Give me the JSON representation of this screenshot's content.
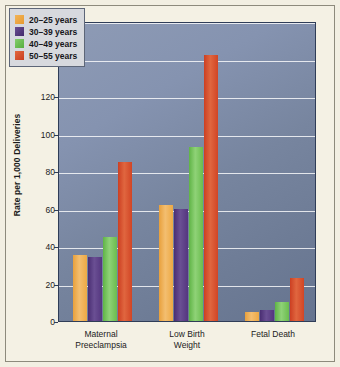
{
  "chart_data": {
    "type": "bar",
    "title": "",
    "subtitle": "",
    "xlabel": "",
    "ylabel": "Rate per 1,000 Deliveries",
    "ylim": [
      0,
      160
    ],
    "yticks": [
      0,
      20,
      40,
      60,
      80,
      100,
      120,
      140,
      160
    ],
    "ytick_labels": [
      "0",
      "20",
      "40",
      "60",
      "80",
      "100",
      "120",
      "140",
      "160"
    ],
    "grid": true,
    "legend_position": "top-left",
    "categories": [
      "Maternal Preeclampsia",
      "Low Birth Weight",
      "Fetal Death"
    ],
    "category_lines": [
      [
        "Maternal",
        "Preeclampsia"
      ],
      [
        "Low Birth",
        "Weight"
      ],
      [
        "Fetal Death",
        ""
      ]
    ],
    "series": [
      {
        "name": "20–25 years",
        "color": "#eda944",
        "values": [
          35,
          62,
          5
        ]
      },
      {
        "name": "30–39 years",
        "color": "#54367f",
        "values": [
          34,
          60,
          6
        ]
      },
      {
        "name": "40–49 years",
        "color": "#6abc4e",
        "values": [
          45,
          93,
          10
        ]
      },
      {
        "name": "50–55 years",
        "color": "#d14525",
        "values": [
          85,
          142,
          23
        ]
      }
    ]
  },
  "legend": {
    "items": [
      {
        "label": "20–25 years"
      },
      {
        "label": "30–39 years"
      },
      {
        "label": "40–49 years"
      },
      {
        "label": "50–55 years"
      }
    ]
  },
  "axes": {
    "y_title": "Rate per 1,000 Deliveries"
  },
  "colors": {
    "series_1": "#eda944",
    "series_2": "#54367f",
    "series_3": "#6abc4e",
    "series_4": "#d14525",
    "plot_background": "#7b89a4",
    "page_background": "#f4f1e4",
    "gridline": "#ffffff",
    "axis": "#2f3d57"
  }
}
